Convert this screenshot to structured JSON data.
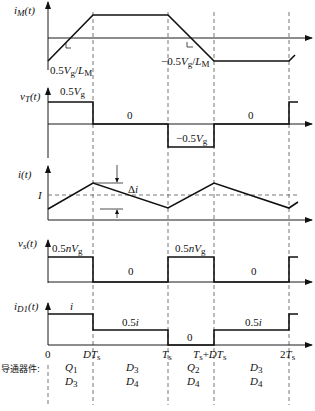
{
  "diagram": {
    "time_ticks": [
      {
        "label": "0",
        "x": 48
      },
      {
        "label": "DTs",
        "x": 93
      },
      {
        "label": "Ts",
        "x": 168
      },
      {
        "label": "Ts+DTs",
        "x": 214
      },
      {
        "label": "2Ts",
        "x": 289
      }
    ],
    "panels": [
      {
        "name": "magnetizing-current",
        "ylabel": "iM(t)",
        "annotations": [
          "0.5Vg/LM",
          "−0.5Vg/LM"
        ]
      },
      {
        "name": "transformer-voltage",
        "ylabel": "vT(t)",
        "annotations": [
          "0.5Vg",
          "0",
          "−0.5Vg",
          "0"
        ]
      },
      {
        "name": "inductor-current",
        "ylabel": "i(t)",
        "annotations": [
          "I",
          "Δi"
        ]
      },
      {
        "name": "switch-voltage",
        "ylabel": "vs(t)",
        "annotations": [
          "0.5nVg",
          "0",
          "0.5nVg",
          "0"
        ]
      },
      {
        "name": "diode-current",
        "ylabel": "iD1(t)",
        "annotations": [
          "i",
          "0.5i",
          "0",
          "0.5i"
        ]
      }
    ],
    "conducting_devices": {
      "label": "导通器件:",
      "intervals": [
        {
          "top": "Q1",
          "bottom": "D3"
        },
        {
          "top": "D3",
          "bottom": "D4"
        },
        {
          "top": "Q2",
          "bottom": "D4"
        },
        {
          "top": "D3",
          "bottom": "D4"
        }
      ]
    }
  }
}
